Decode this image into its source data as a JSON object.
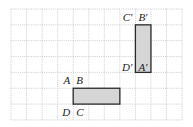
{
  "grid": {
    "origin_x": 11,
    "origin_y": 9,
    "cols": 11,
    "rows": 7,
    "cell_w": 15.55,
    "cell_h": 15.85,
    "line_color": "#c8c8c8"
  },
  "shapes": [
    {
      "name": "rectangle-abcd",
      "col": 4,
      "row": 5,
      "w": 3,
      "h": 1,
      "fill": "#d6d6d6",
      "stroke": "#2a2a2a",
      "labels": [
        {
          "text": "A",
          "corner": "tl"
        },
        {
          "text": "B",
          "corner": "tr"
        },
        {
          "text": "C",
          "corner": "br"
        },
        {
          "text": "D",
          "corner": "bl"
        }
      ]
    },
    {
      "name": "rectangle-abcd-prime",
      "col": 8,
      "row": 1,
      "w": 1,
      "h": 3,
      "fill": "#d6d6d6",
      "stroke": "#2a2a2a",
      "labels": [
        {
          "text": "C′",
          "corner": "tl"
        },
        {
          "text": "B′",
          "corner": "tr"
        },
        {
          "text": "A′",
          "corner": "br"
        },
        {
          "text": "D′",
          "corner": "bl"
        }
      ]
    }
  ]
}
